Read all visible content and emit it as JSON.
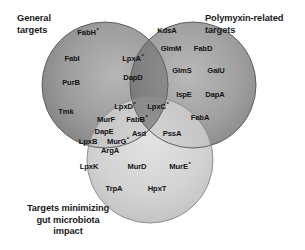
{
  "figure": {
    "type": "venn-diagram",
    "set_count": 3,
    "background_color": "#ffffff",
    "label_color": "#1a1a1a"
  },
  "captions": {
    "general": "General\ntargets",
    "polymyxin": "Polymyxin-related\ntargets",
    "gut": "Targets minimizing\ngut microbiota\nimpact"
  },
  "chart_data": {
    "type": "venn",
    "title": "",
    "sets": [
      {
        "id": "general",
        "label": "General targets",
        "fill": "#8a8a8a",
        "center": [
          105,
          85
        ],
        "radius": 63
      },
      {
        "id": "polymyxin",
        "label": "Polymyxin-related targets",
        "fill": "#8a8a8a",
        "center": [
          193,
          85
        ],
        "radius": 63
      },
      {
        "id": "gut",
        "label": "Targets minimizing gut microbiota impact",
        "fill": "#cfcfcf",
        "center": [
          150,
          160
        ],
        "radius": 63
      }
    ],
    "regions": [
      {
        "id": "general-only",
        "sets": [
          "general"
        ],
        "members": [
          "FabH *",
          "FabI",
          "PurB",
          "Tmk"
        ]
      },
      {
        "id": "polymyxin-only",
        "sets": [
          "polymyxin"
        ],
        "members": [
          "KdsA",
          "GlmM",
          "FabD",
          "GlmS",
          "GalU",
          "IspE",
          "DapA",
          "FabA"
        ]
      },
      {
        "id": "gut-only",
        "sets": [
          "gut"
        ],
        "members": [
          "LpxK",
          "MurD",
          "MurE *",
          "TrpA",
          "HpxT"
        ]
      },
      {
        "id": "general-polymyxin",
        "sets": [
          "general",
          "polymyxin"
        ],
        "members": [
          "LpxA *",
          "DapD"
        ]
      },
      {
        "id": "general-gut",
        "sets": [
          "general",
          "gut"
        ],
        "members": [
          "MurF",
          "DapE",
          "LpxB",
          "MurG *",
          "ArgA"
        ]
      },
      {
        "id": "polymyxin-gut",
        "sets": [
          "polymyxin",
          "gut"
        ],
        "members": [
          "PssA"
        ]
      },
      {
        "id": "all-three",
        "sets": [
          "general",
          "polymyxin",
          "gut"
        ],
        "members": [
          "LpxD *",
          "LpxC *",
          "FabB *",
          "Asd"
        ]
      }
    ]
  },
  "nodes": [
    {
      "id": "fabh",
      "text": "FabH",
      "asterisk": true,
      "x": 88,
      "y": 32
    },
    {
      "id": "fabi",
      "text": "FabI",
      "asterisk": false,
      "x": 72,
      "y": 58
    },
    {
      "id": "purb",
      "text": "PurB",
      "asterisk": false,
      "x": 71,
      "y": 82
    },
    {
      "id": "tmk",
      "text": "Tmk",
      "asterisk": false,
      "x": 66,
      "y": 111
    },
    {
      "id": "kdsa",
      "text": "KdsA",
      "asterisk": false,
      "x": 167,
      "y": 30
    },
    {
      "id": "glmm",
      "text": "GlmM",
      "asterisk": false,
      "x": 171,
      "y": 48
    },
    {
      "id": "fabd",
      "text": "FabD",
      "asterisk": false,
      "x": 203,
      "y": 48
    },
    {
      "id": "glms",
      "text": "GlmS",
      "asterisk": false,
      "x": 182,
      "y": 70
    },
    {
      "id": "galu",
      "text": "GalU",
      "asterisk": false,
      "x": 216,
      "y": 70
    },
    {
      "id": "ispe",
      "text": "IspE",
      "asterisk": false,
      "x": 184,
      "y": 94
    },
    {
      "id": "dapa",
      "text": "DapA",
      "asterisk": false,
      "x": 215,
      "y": 94
    },
    {
      "id": "faba",
      "text": "FabA",
      "asterisk": false,
      "x": 200,
      "y": 117
    },
    {
      "id": "lpxa",
      "text": "LpxA",
      "asterisk": true,
      "x": 133,
      "y": 58
    },
    {
      "id": "dapd",
      "text": "DapD",
      "asterisk": false,
      "x": 133,
      "y": 77
    },
    {
      "id": "lpxd",
      "text": "LpxD",
      "asterisk": true,
      "x": 125,
      "y": 106
    },
    {
      "id": "lpxc",
      "text": "LpxC",
      "asterisk": true,
      "x": 158,
      "y": 106
    },
    {
      "id": "fabb",
      "text": "FabB",
      "asterisk": true,
      "x": 137,
      "y": 119
    },
    {
      "id": "asd",
      "text": "Asd",
      "asterisk": false,
      "x": 139,
      "y": 133
    },
    {
      "id": "murf",
      "text": "MurF",
      "asterisk": false,
      "x": 106,
      "y": 119
    },
    {
      "id": "dape",
      "text": "DapE",
      "asterisk": false,
      "x": 104,
      "y": 131
    },
    {
      "id": "lpxb",
      "text": "LpxB",
      "asterisk": false,
      "x": 88,
      "y": 141
    },
    {
      "id": "murg",
      "text": "MurG",
      "asterisk": true,
      "x": 118,
      "y": 141
    },
    {
      "id": "arga",
      "text": "ArgA",
      "asterisk": false,
      "x": 110,
      "y": 150
    },
    {
      "id": "pssa",
      "text": "PssA",
      "asterisk": false,
      "x": 172,
      "y": 133
    },
    {
      "id": "lpxk",
      "text": "LpxK",
      "asterisk": false,
      "x": 89,
      "y": 166
    },
    {
      "id": "murd",
      "text": "MurD",
      "asterisk": false,
      "x": 137,
      "y": 166
    },
    {
      "id": "mure",
      "text": "MurE",
      "asterisk": true,
      "x": 180,
      "y": 166
    },
    {
      "id": "trpa",
      "text": "TrpA",
      "asterisk": false,
      "x": 114,
      "y": 188
    },
    {
      "id": "hpxt",
      "text": "HpxT",
      "asterisk": false,
      "x": 157,
      "y": 188
    }
  ]
}
